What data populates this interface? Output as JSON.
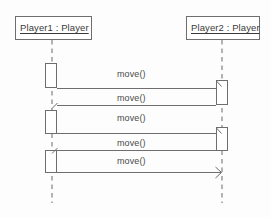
{
  "diagram": {
    "type": "uml-sequence-diagram",
    "background_color": "#fdfdfd",
    "line_color": "#6e6e6e",
    "lifeline_color": "#9a9a9a",
    "text_color": "#3a3a3a",
    "activation_fill": "#ffffff",
    "participants": [
      {
        "id": "player1",
        "label": "Player1 : Player",
        "box": {
          "x": 15,
          "y": 16,
          "w": 77,
          "h": 24
        },
        "lifeline_x": 52,
        "lifeline_top": 40,
        "lifeline_bottom": 203,
        "activations": [
          {
            "x": 45,
            "y": 63,
            "w": 12,
            "h": 25
          },
          {
            "x": 45,
            "y": 110,
            "w": 12,
            "h": 24
          },
          {
            "x": 45,
            "y": 150,
            "w": 12,
            "h": 23
          }
        ]
      },
      {
        "id": "player2",
        "label": "Player2 : Player",
        "box": {
          "x": 186,
          "y": 16,
          "w": 74,
          "h": 24
        },
        "lifeline_x": 222,
        "lifeline_top": 40,
        "lifeline_bottom": 203,
        "activations": [
          {
            "x": 216,
            "y": 80,
            "w": 12,
            "h": 25
          },
          {
            "x": 216,
            "y": 127,
            "w": 12,
            "h": 24
          }
        ]
      }
    ],
    "messages": [
      {
        "index": 1,
        "label": "move()",
        "from": "player1",
        "to": "player2",
        "y": 88,
        "direction": "right",
        "arrow": "half-open",
        "label_x": 131,
        "label_y": 71
      },
      {
        "index": 2,
        "label": "move()",
        "from": "player2",
        "to": "player1",
        "y": 105,
        "direction": "left",
        "arrow": "half-open",
        "label_x": 131,
        "label_y": 96
      },
      {
        "index": 3,
        "label": "move()",
        "from": "player1",
        "to": "player2",
        "y": 133,
        "direction": "right",
        "arrow": "half-open",
        "label_x": 131,
        "label_y": 115
      },
      {
        "index": 4,
        "label": "move()",
        "from": "player2",
        "to": "player1",
        "y": 150,
        "direction": "left",
        "arrow": "half-open",
        "label_x": 131,
        "label_y": 141
      },
      {
        "index": 5,
        "label": "move()",
        "from": "player1",
        "to": "player2",
        "y": 172,
        "direction": "right",
        "arrow": "open",
        "label_x": 131,
        "label_y": 158
      }
    ]
  }
}
